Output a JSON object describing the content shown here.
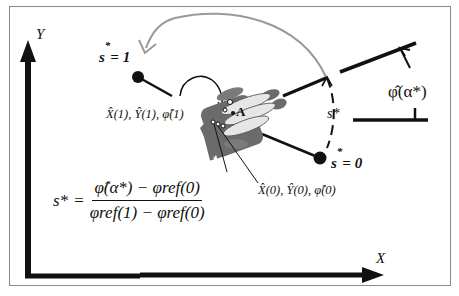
{
  "diagram": {
    "axes": {
      "x_label": "X",
      "y_label": "Y"
    },
    "points": {
      "start": {
        "label": "s* = 0",
        "pose_label": "X̂(0), Ŷ(0), φ̂(0)"
      },
      "end": {
        "label": "s* = 1",
        "pose_label": "X̂(1), Ŷ(1), φ̂(1)"
      },
      "hand_point": "A"
    },
    "arc_label": "s*",
    "angle_label": "φ̂(α*)",
    "formula": {
      "lhs": "s*",
      "equals": "=",
      "numerator": "φ̂(α*) − φref(0)",
      "denominator": "φref(1) − φref(0)"
    },
    "colors": {
      "axis": "#111111",
      "arc": "#9a9a9a",
      "hand_dark": "#6b6b6b",
      "hand_light": "#d9d9d9",
      "frame": "#8a8a8a"
    }
  }
}
